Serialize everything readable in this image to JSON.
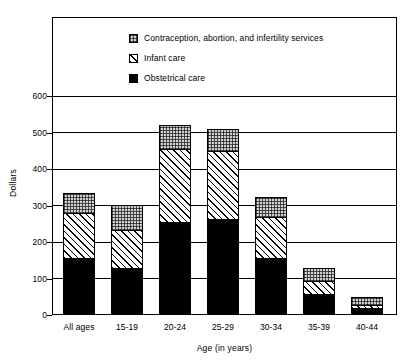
{
  "chart_data": {
    "type": "bar",
    "subtype": "stacked",
    "title": "",
    "xlabel": "Age (in years)",
    "ylabel": "Dollars",
    "ylim": [
      0,
      600
    ],
    "yticks": [
      0,
      100,
      200,
      300,
      400,
      500,
      600
    ],
    "ytick_labels": [
      "0",
      "100",
      "200",
      "300",
      "400",
      "500",
      "600"
    ],
    "grid": true,
    "grid_axis": "y",
    "legend_position": "top-center-inside",
    "categories": [
      "All ages",
      "15-19",
      "20-24",
      "25-29",
      "30-34",
      "35-39",
      "40-44"
    ],
    "series": [
      {
        "name": "Obstetrical care",
        "pattern": "solid-black",
        "color": "#000000",
        "values": [
          152,
          122,
          250,
          257,
          150,
          52,
          15
        ]
      },
      {
        "name": "Infant care",
        "pattern": "diagonal-hatch",
        "color": "#ffffff",
        "values": [
          123,
          106,
          200,
          186,
          112,
          35,
          7
        ]
      },
      {
        "name": "Contraception, abortion, and infertility services",
        "pattern": "stipple-gray",
        "color": "#cfcfcf",
        "values": [
          55,
          69,
          65,
          62,
          55,
          35,
          23
        ]
      }
    ],
    "totals": [
      330,
      297,
      515,
      505,
      317,
      122,
      45
    ],
    "cumulative_tops": [
      [
        152,
        275,
        330
      ],
      [
        122,
        228,
        297
      ],
      [
        250,
        450,
        515
      ],
      [
        257,
        443,
        505
      ],
      [
        150,
        262,
        317
      ],
      [
        52,
        87,
        122
      ],
      [
        15,
        22,
        45
      ]
    ]
  },
  "legend": {
    "items": [
      {
        "label": "Contraception, abortion, and infertility services",
        "swatch": "stipple-gray-swatch"
      },
      {
        "label": "Infant care",
        "swatch": "diagonal-hatch-swatch"
      },
      {
        "label": "Obstetrical care",
        "swatch": "solid-black-swatch"
      }
    ]
  },
  "axes": {
    "y_title": "Dollars",
    "x_title": "Age (in years)",
    "y_labels": [
      "600",
      "500",
      "400",
      "300",
      "200",
      "100",
      "0"
    ],
    "x_labels": [
      "All ages",
      "15-19",
      "20-24",
      "25-29",
      "30-34",
      "35-39",
      "40-44"
    ]
  }
}
